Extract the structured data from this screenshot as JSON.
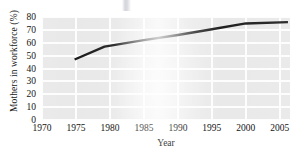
{
  "chart_data": {
    "type": "line",
    "title": "",
    "subtitle": "",
    "xlabel": "Year",
    "ylabel": "Mothers in workforce (%)",
    "xlim": [
      1970,
      2006.5
    ],
    "ylim": [
      0,
      80
    ],
    "xticks": [
      "1970",
      "1975",
      "1980",
      "1985",
      "1990",
      "1995",
      "2000",
      "2005"
    ],
    "yticks": [
      "0",
      "10",
      "20",
      "30",
      "40",
      "50",
      "60",
      "70",
      "80"
    ],
    "grid": "both-axes-white-gridlines",
    "legend": "none",
    "series": [
      {
        "name": "Mothers in workforce",
        "color": "#171717",
        "x": [
          1974.8,
          1979.2,
          1985.0,
          1990.0,
          1995.0,
          2000.0,
          2006.2
        ],
        "values": [
          47,
          57,
          62,
          66,
          70.5,
          75,
          76
        ]
      }
    ],
    "annotations": []
  },
  "axes": {
    "y_title": "Mothers in workforce (%)",
    "x_title": "Year"
  },
  "style": {
    "plot_background": "#e8e8e8",
    "gridline_color": "#fdfdfd",
    "line_color": "#171717",
    "text_color": "#141414",
    "page_background": "#ffffff"
  }
}
